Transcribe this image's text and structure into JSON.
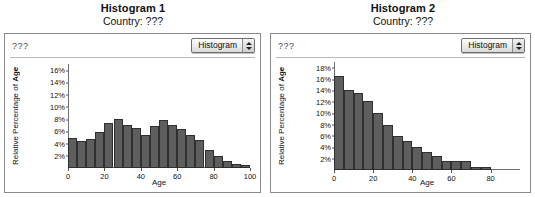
{
  "panels": [
    {
      "title": "Histogram 1",
      "subtitle": "Country: ???",
      "corner_label": "???",
      "popup_label": "Histogram",
      "chart_data": {
        "type": "bar",
        "title": "Histogram 1",
        "xlabel": "Age",
        "ylabel": "Relative Percentage of Age",
        "xlim": [
          0,
          100
        ],
        "ylim": [
          0,
          17
        ],
        "xticks": [
          0,
          20,
          40,
          60,
          80,
          100
        ],
        "yticks": [
          "2%",
          "4%",
          "6%",
          "8%",
          "10%",
          "12%",
          "14%",
          "16%"
        ],
        "ytick_values": [
          2,
          4,
          6,
          8,
          10,
          12,
          14,
          16
        ],
        "grid": false,
        "legend": "none",
        "bin_width": 5,
        "categories": [
          "0-5",
          "5-10",
          "10-15",
          "15-20",
          "20-25",
          "25-30",
          "30-35",
          "35-40",
          "40-45",
          "45-50",
          "50-55",
          "55-60",
          "60-65",
          "65-70",
          "70-75",
          "75-80",
          "80-85",
          "85-90",
          "90-95",
          "95-100"
        ],
        "values": [
          4.9,
          4.4,
          4.8,
          5.9,
          7.3,
          8.0,
          7.0,
          6.5,
          5.4,
          6.9,
          7.9,
          7.0,
          6.3,
          5.4,
          4.5,
          3.0,
          2.0,
          1.1,
          0.6,
          0.5
        ]
      }
    },
    {
      "title": "Histogram 2",
      "subtitle": "Country: ???",
      "corner_label": "???",
      "popup_label": "Histogram",
      "chart_data": {
        "type": "bar",
        "title": "Histogram 2",
        "xlabel": "Age",
        "ylabel": "Relative Percentage of Age",
        "xlim": [
          0,
          95
        ],
        "ylim": [
          0,
          19
        ],
        "xticks": [
          0,
          20,
          40,
          60,
          80
        ],
        "yticks": [
          "2%",
          "4%",
          "6%",
          "8%",
          "10%",
          "12%",
          "14%",
          "16%",
          "18%"
        ],
        "ytick_values": [
          2,
          4,
          6,
          8,
          10,
          12,
          14,
          16,
          18
        ],
        "grid": false,
        "legend": "none",
        "bin_width": 5,
        "categories": [
          "0-5",
          "5-10",
          "10-15",
          "15-20",
          "20-25",
          "25-30",
          "30-35",
          "35-40",
          "40-45",
          "45-50",
          "50-55",
          "55-60",
          "60-65",
          "65-70",
          "70-75",
          "75-80"
        ],
        "values": [
          16.5,
          14.1,
          13.6,
          12.1,
          10.1,
          8.0,
          6.0,
          5.1,
          4.0,
          3.1,
          2.4,
          1.6,
          1.5,
          1.5,
          0.5,
          0.45
        ]
      }
    }
  ]
}
